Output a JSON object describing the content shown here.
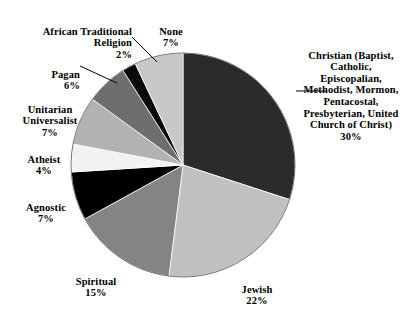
{
  "chart_data": {
    "type": "pie",
    "title": "",
    "subtitle": "",
    "xlabel": "",
    "ylabel": "",
    "legend_position": "none",
    "grid": false,
    "units": "percent",
    "start_angle_deg": 0,
    "direction": "clockwise",
    "categories": [
      "Christian (Baptist, Catholic, Episcopalian, Methodist, Mormon, Pentacostal, Presbyterian, United Church of Christ)",
      "Jewish",
      "Spiritual",
      "Agnostic",
      "Atheist",
      "Unitarian Universalist",
      "Pagan",
      "African Traditional Religion",
      "None"
    ],
    "values": [
      30,
      22,
      15,
      7,
      4,
      7,
      6,
      2,
      7
    ],
    "colors": [
      "#2b2b2b",
      "#c0c0c0",
      "#848484",
      "#000000",
      "#f2f2f2",
      "#b2b2b2",
      "#6e6e6e",
      "#0a0a0a",
      "#c8c8c8"
    ],
    "slices": [
      {
        "id": "christian",
        "label": "Christian (Baptist, Catholic, Episcopalian, Methodist, Mormon, Pentacostal, Presbyterian, United Church of Christ)",
        "label_display": "Christian (Baptist,\nCatholic,\nEpiscopalian,\nMethodist, Mormon,\nPentacostal,\nPresbyterian, United\nChurch of Christ)",
        "value": 30,
        "percent_text": "30%",
        "color": "#2b2b2b",
        "leader_line": true
      },
      {
        "id": "jewish",
        "label": "Jewish",
        "label_display": "Jewish",
        "value": 22,
        "percent_text": "22%",
        "color": "#c0c0c0",
        "leader_line": false
      },
      {
        "id": "spiritual",
        "label": "Spiritual",
        "label_display": "Spiritual",
        "value": 15,
        "percent_text": "15%",
        "color": "#848484",
        "leader_line": false
      },
      {
        "id": "agnostic",
        "label": "Agnostic",
        "label_display": "Agnostic",
        "value": 7,
        "percent_text": "7%",
        "color": "#000000",
        "leader_line": false
      },
      {
        "id": "atheist",
        "label": "Atheist",
        "label_display": "Atheist",
        "value": 4,
        "percent_text": "4%",
        "color": "#f2f2f2",
        "leader_line": false
      },
      {
        "id": "unitarian-universalist",
        "label": "Unitarian Universalist",
        "label_display": "Unitarian\nUniversalist",
        "value": 7,
        "percent_text": "7%",
        "color": "#b2b2b2",
        "leader_line": false
      },
      {
        "id": "pagan",
        "label": "Pagan",
        "label_display": "Pagan",
        "value": 6,
        "percent_text": "6%",
        "color": "#6e6e6e",
        "leader_line": true
      },
      {
        "id": "african-traditional-religion",
        "label": "African Traditional Religion",
        "label_display": "African Traditional\nReligion",
        "value": 2,
        "percent_text": "2%",
        "color": "#0a0a0a",
        "leader_line": true
      },
      {
        "id": "none",
        "label": "None",
        "label_display": "None",
        "value": 7,
        "percent_text": "7%",
        "color": "#c8c8c8",
        "leader_line": false
      }
    ]
  }
}
